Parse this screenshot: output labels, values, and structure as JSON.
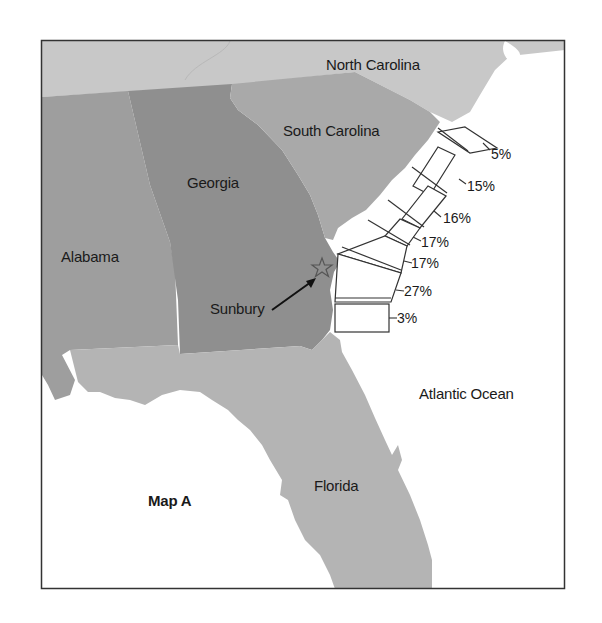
{
  "map": {
    "title": "Map A",
    "colors": {
      "georgia": "#8f8f8f",
      "south_carolina": "#a9a9a9",
      "alabama": "#9e9e9e",
      "north_carolina": "#c8c8c8",
      "florida": "#b4b4b4",
      "tennessee": "#c8c8c8",
      "ocean": "#ffffff",
      "frame": "#333333"
    },
    "labels": {
      "north_carolina": "North Carolina",
      "south_carolina": "South Carolina",
      "georgia": "Georgia",
      "alabama": "Alabama",
      "florida": "Florida",
      "atlantic_ocean": "Atlantic Ocean",
      "sunbury": "Sunbury"
    },
    "marker": {
      "name": "Sunbury",
      "icon": "star-icon"
    },
    "coastal_segments": [
      {
        "value": "5%"
      },
      {
        "value": "15%"
      },
      {
        "value": "16%"
      },
      {
        "value": "17%"
      },
      {
        "value": "17%"
      },
      {
        "value": "27%"
      },
      {
        "value": "3%"
      }
    ]
  }
}
